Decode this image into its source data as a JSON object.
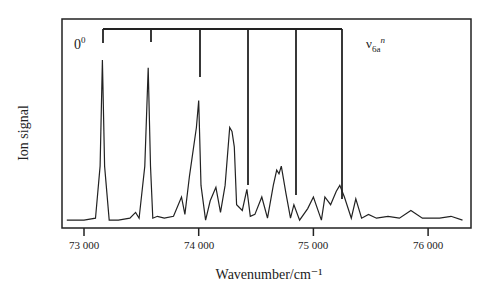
{
  "chart_data": {
    "type": "line",
    "title": "",
    "xlabel": "Wavenumber/cm⁻¹",
    "ylabel": "Ion signal",
    "xlim": [
      72800,
      76350
    ],
    "xticks": [
      73000,
      74000,
      75000,
      76000
    ],
    "xtick_labels": [
      "73 000",
      "74 000",
      "75 000",
      "76 000"
    ],
    "yticks": [],
    "grid": false,
    "legend": null,
    "series": [
      {
        "name": "Ion signal spectrum",
        "x": [
          72850,
          73000,
          73100,
          73140,
          73160,
          73180,
          73220,
          73300,
          73400,
          73450,
          73480,
          73530,
          73560,
          73580,
          73600,
          73640,
          73700,
          73780,
          73850,
          73880,
          73920,
          73980,
          74000,
          74020,
          74060,
          74100,
          74150,
          74190,
          74230,
          74270,
          74290,
          74310,
          74330,
          74380,
          74420,
          74450,
          74490,
          74550,
          74600,
          74650,
          74680,
          74700,
          74720,
          74760,
          74800,
          74830,
          74880,
          74950,
          75000,
          75070,
          75100,
          75150,
          75200,
          75230,
          75270,
          75330,
          75370,
          75420,
          75480,
          75550,
          75650,
          75750,
          75850,
          75950,
          76100,
          76200,
          76300
        ],
        "y": [
          0.02,
          0.02,
          0.03,
          0.3,
          0.85,
          0.3,
          0.02,
          0.02,
          0.03,
          0.06,
          0.03,
          0.3,
          0.81,
          0.3,
          0.03,
          0.04,
          0.03,
          0.04,
          0.14,
          0.05,
          0.25,
          0.5,
          0.64,
          0.2,
          0.02,
          0.12,
          0.19,
          0.06,
          0.2,
          0.5,
          0.48,
          0.4,
          0.1,
          0.07,
          0.18,
          0.04,
          0.05,
          0.14,
          0.03,
          0.2,
          0.28,
          0.26,
          0.3,
          0.16,
          0.03,
          0.1,
          0.02,
          0.08,
          0.14,
          0.02,
          0.14,
          0.1,
          0.17,
          0.2,
          0.14,
          0.03,
          0.13,
          0.03,
          0.05,
          0.03,
          0.04,
          0.03,
          0.07,
          0.03,
          0.03,
          0.04,
          0.02
        ]
      }
    ],
    "annotations": [
      {
        "text": "0⁰",
        "x": 72950,
        "position": "upper-left"
      },
      {
        "text": "ν6a^n",
        "x": 75470,
        "position": "upper-right"
      },
      {
        "type": "progression_bracket",
        "label": "ν6a n",
        "x": [
          73165,
          73585,
          74010,
          74430,
          74855,
          75250
        ]
      }
    ]
  },
  "labels": {
    "ylabel": "Ion signal",
    "xlabel": "Wavenumber/cm⁻¹",
    "origin_base": "0",
    "origin_sup": "0",
    "prog_base": "ν",
    "prog_sub": "6a",
    "prog_sup": "n",
    "ticks": [
      "73 000",
      "74 000",
      "75 000",
      "76 000"
    ]
  }
}
